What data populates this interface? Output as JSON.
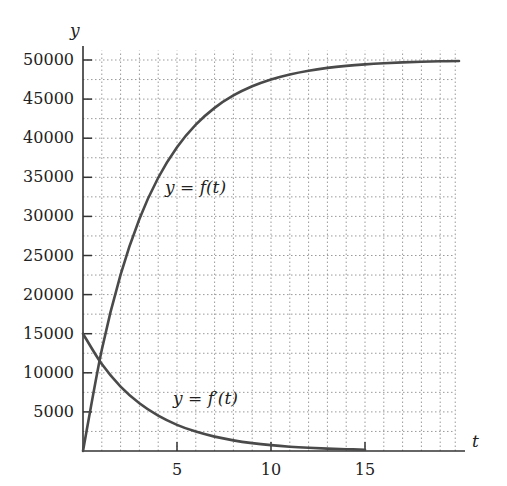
{
  "chart_data": {
    "type": "line",
    "title": "",
    "xlabel": "t",
    "ylabel": "y",
    "xlim": [
      0,
      20
    ],
    "ylim": [
      0,
      51000
    ],
    "x_ticks": [
      5,
      10,
      15
    ],
    "x_tick_labels": [
      "5",
      "10",
      "15"
    ],
    "y_ticks": [
      5000,
      10000,
      15000,
      20000,
      25000,
      30000,
      35000,
      40000,
      45000,
      50000
    ],
    "y_tick_labels": [
      "5000",
      "10000",
      "15000",
      "20000",
      "25000",
      "30000",
      "35000",
      "40000",
      "45000",
      "50000"
    ],
    "grid": {
      "on": true,
      "style": "dotted",
      "x_step": 1,
      "y_step": 2500
    },
    "legend": null,
    "annotations": [
      {
        "text": "y = f(t)",
        "x": 4.5,
        "y": 33000
      },
      {
        "text": "y = f′(t)",
        "x": 5,
        "y": 6500
      }
    ],
    "series": [
      {
        "name": "y = f(t)",
        "x": [
          0,
          1,
          2,
          3,
          4,
          5,
          6,
          7,
          8,
          9,
          10,
          11,
          12,
          13,
          14,
          15,
          16,
          17,
          18,
          19,
          20
        ],
        "values": [
          0,
          12959,
          22559,
          29671,
          34940,
          38843,
          41735,
          43877,
          45464,
          46640,
          47511,
          48156,
          48634,
          48988,
          49250,
          49444,
          49588,
          49694,
          49774,
          49832,
          49876
        ]
      },
      {
        "name": "y = f′(t)",
        "x": [
          0,
          1,
          2,
          3,
          4,
          5,
          6,
          7,
          8,
          9,
          10,
          11,
          12,
          13,
          14,
          15
        ],
        "values": [
          15000,
          11112,
          8232,
          6099,
          4518,
          3347,
          2479,
          1837,
          1361,
          1008,
          747,
          553,
          410,
          304,
          225,
          167
        ]
      }
    ]
  }
}
